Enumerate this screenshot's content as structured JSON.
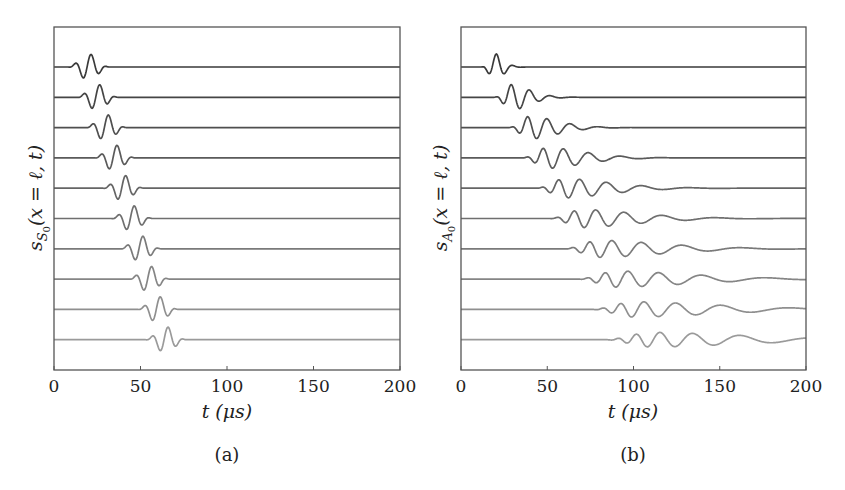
{
  "figure": {
    "panels": [
      {
        "id": "a",
        "caption": "(a)",
        "ylabel": "s_{S_0}(x = ℓ, t)",
        "ylabel_main": "s",
        "ylabel_sub": "S",
        "ylabel_subsub": "0",
        "ylabel_rest": "(x = ℓ, t)",
        "xlabel": "t (μs)",
        "xticks": [
          "0",
          "50",
          "100",
          "150",
          "200"
        ]
      },
      {
        "id": "b",
        "caption": "(b)",
        "ylabel": "s_{A_0}(x = ℓ, t)",
        "ylabel_main": "s",
        "ylabel_sub": "A",
        "ylabel_subsub": "0",
        "ylabel_rest": "(x = ℓ, t)",
        "xlabel": "t (μs)",
        "xticks": [
          "0",
          "50",
          "100",
          "150",
          "200"
        ]
      }
    ]
  },
  "colors": {
    "trace_dark": "#3a3a3a",
    "trace_light": "#9a9a9a",
    "axis": "#555555"
  },
  "chart_data": [
    {
      "type": "line",
      "title": "(a)",
      "xlabel": "t (μs)",
      "ylabel": "s_S0(x = ℓ, t)",
      "xlim": [
        0,
        200
      ],
      "xticks": [
        0,
        50,
        100,
        150,
        200
      ],
      "yticks": [],
      "grid": false,
      "legend": null,
      "description": "Ten vertically offset S0-mode (non-dispersive) tone-burst signals at increasing propagation distance; pulse shape preserved, arrival time increasing linearly.",
      "series": [
        {
          "name": "trace 1",
          "center_us": 21.5,
          "spread": 1.0,
          "freq_cycles_per_us": 0.105
        },
        {
          "name": "trace 2",
          "center_us": 26.5,
          "spread": 1.0,
          "freq_cycles_per_us": 0.105
        },
        {
          "name": "trace 3",
          "center_us": 31.5,
          "spread": 1.0,
          "freq_cycles_per_us": 0.105
        },
        {
          "name": "trace 4",
          "center_us": 36.5,
          "spread": 1.0,
          "freq_cycles_per_us": 0.105
        },
        {
          "name": "trace 5",
          "center_us": 41.5,
          "spread": 1.0,
          "freq_cycles_per_us": 0.105
        },
        {
          "name": "trace 6",
          "center_us": 46.5,
          "spread": 1.0,
          "freq_cycles_per_us": 0.105
        },
        {
          "name": "trace 7",
          "center_us": 51.5,
          "spread": 1.0,
          "freq_cycles_per_us": 0.105
        },
        {
          "name": "trace 8",
          "center_us": 56.5,
          "spread": 1.0,
          "freq_cycles_per_us": 0.105
        },
        {
          "name": "trace 9",
          "center_us": 61.5,
          "spread": 1.0,
          "freq_cycles_per_us": 0.105
        },
        {
          "name": "trace 10",
          "center_us": 66.0,
          "spread": 1.0,
          "freq_cycles_per_us": 0.105
        }
      ]
    },
    {
      "type": "line",
      "title": "(b)",
      "xlabel": "t (μs)",
      "ylabel": "s_A0(x = ℓ, t)",
      "xlim": [
        0,
        200
      ],
      "xticks": [
        0,
        50,
        100,
        150,
        200
      ],
      "yticks": [],
      "grid": false,
      "legend": null,
      "description": "Ten vertically offset A0-mode (dispersive) signals; wave packets spread and develop long low-frequency tails with increasing distance.",
      "series": [
        {
          "name": "trace 1",
          "center_us": 20.5,
          "spread": 1.0,
          "freq_cycles_per_us": 0.105
        },
        {
          "name": "trace 2",
          "center_us": 29.0,
          "spread": 1.35,
          "freq_cycles_per_us": 0.105
        },
        {
          "name": "trace 3",
          "center_us": 38.5,
          "spread": 1.7,
          "freq_cycles_per_us": 0.105
        },
        {
          "name": "trace 4",
          "center_us": 47.5,
          "spread": 2.05,
          "freq_cycles_per_us": 0.105
        },
        {
          "name": "trace 5",
          "center_us": 56.5,
          "spread": 2.4,
          "freq_cycles_per_us": 0.105
        },
        {
          "name": "trace 6",
          "center_us": 65.5,
          "spread": 2.75,
          "freq_cycles_per_us": 0.105
        },
        {
          "name": "trace 7",
          "center_us": 74.5,
          "spread": 3.1,
          "freq_cycles_per_us": 0.105
        },
        {
          "name": "trace 8",
          "center_us": 83.5,
          "spread": 3.45,
          "freq_cycles_per_us": 0.105
        },
        {
          "name": "trace 9",
          "center_us": 92.5,
          "spread": 3.8,
          "freq_cycles_per_us": 0.105
        },
        {
          "name": "trace 10",
          "center_us": 101.5,
          "spread": 4.15,
          "freq_cycles_per_us": 0.105
        }
      ]
    }
  ]
}
